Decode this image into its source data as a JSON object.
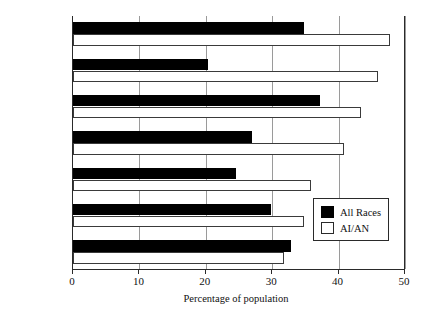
{
  "chart_data": {
    "type": "bar",
    "orientation": "horizontal",
    "title": "",
    "xlabel": "Percentage of population",
    "ylabel": "",
    "xlim": [
      0,
      50
    ],
    "xticks": [
      0,
      10,
      20,
      30,
      40,
      50
    ],
    "grid": true,
    "grid_axis": "x",
    "legend_position": "lower-right-inside",
    "categories": [
      "Arizona",
      "Minnesota",
      "New Mexico",
      "Oregon",
      "Washington",
      "Oklahoma",
      "California"
    ],
    "series": [
      {
        "name": "All Races",
        "color": "#000000",
        "style": "filled",
        "values": [
          34.8,
          20.3,
          37.2,
          27.0,
          24.5,
          29.8,
          32.8
        ]
      },
      {
        "name": "AI/AN",
        "color": "#ffffff",
        "style": "hollow",
        "values": [
          47.7,
          46.0,
          43.4,
          40.8,
          35.8,
          34.8,
          31.8
        ]
      }
    ]
  },
  "legend": {
    "entries": [
      {
        "label": "All Races",
        "swatch": "filled-black-square"
      },
      {
        "label": "AI/AN",
        "swatch": "hollow-white-square"
      }
    ]
  },
  "axis": {
    "x_title": "Percentage of population",
    "tick_labels": [
      "0",
      "10",
      "20",
      "30",
      "40",
      "50"
    ]
  }
}
